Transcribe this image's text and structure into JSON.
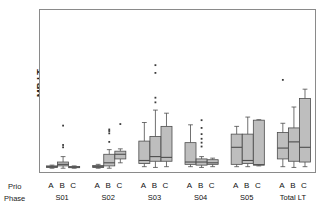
{
  "chart": {
    "type": "box",
    "ylabel": "MR LT",
    "prio_axis_label": "Prio",
    "phase_axis_label": "Phase"
  },
  "chart_data": {
    "type": "box",
    "title": "",
    "xlabel": "",
    "ylabel": "MR LT",
    "axis_rows": [
      "Prio",
      "Phase"
    ],
    "grid": false,
    "legend": "none",
    "y_tick_labels": [],
    "ylim": [
      0,
      100
    ],
    "groups": [
      "S01",
      "S02",
      "S03",
      "S04",
      "S05",
      "Total LT"
    ],
    "priorities": [
      "A",
      "B",
      "C"
    ],
    "box_fill": "#b3b3b3",
    "box_line": "#4d4d4d",
    "boxes": [
      {
        "group": "S01",
        "prio": "A",
        "whisker_low": 0.5,
        "q1": 1.0,
        "median": 1.5,
        "q3": 2.0,
        "whisker_high": 2.5,
        "outliers": []
      },
      {
        "group": "S01",
        "prio": "B",
        "whisker_low": 0.5,
        "q1": 2.0,
        "median": 3.0,
        "q3": 4.5,
        "whisker_high": 8.0,
        "outliers": [
          14.0,
          15.5,
          28.0
        ]
      },
      {
        "group": "S01",
        "prio": "C",
        "whisker_low": 0.5,
        "q1": 1.0,
        "median": 1.2,
        "q3": 1.6,
        "whisker_high": 2.0,
        "outliers": []
      },
      {
        "group": "S02",
        "prio": "A",
        "whisker_low": 0.5,
        "q1": 1.0,
        "median": 1.5,
        "q3": 2.2,
        "whisker_high": 3.0,
        "outliers": []
      },
      {
        "group": "S02",
        "prio": "B",
        "whisker_low": 0.5,
        "q1": 2.0,
        "median": 4.0,
        "q3": 9.5,
        "whisker_high": 12.5,
        "outliers": [
          17.5,
          23.0,
          24.5,
          25.5
        ]
      },
      {
        "group": "S02",
        "prio": "C",
        "whisker_low": 4.0,
        "q1": 6.5,
        "median": 9.5,
        "q3": 11.5,
        "whisker_high": 13.0,
        "outliers": [
          29.0
        ]
      },
      {
        "group": "S03",
        "prio": "A",
        "whisker_low": 1.5,
        "q1": 3.5,
        "median": 5.5,
        "q3": 18.0,
        "whisker_high": 30.0,
        "outliers": []
      },
      {
        "group": "S03",
        "prio": "B",
        "whisker_low": 1.0,
        "q1": 5.0,
        "median": 8.0,
        "q3": 21.0,
        "whisker_high": 38.0,
        "outliers": [
          43.0,
          46.0,
          62.0,
          67.0
        ]
      },
      {
        "group": "S03",
        "prio": "C",
        "whisker_low": 1.5,
        "q1": 5.0,
        "median": 7.5,
        "q3": 27.5,
        "whisker_high": 36.0,
        "outliers": []
      },
      {
        "group": "S04",
        "prio": "A",
        "whisker_low": 1.5,
        "q1": 3.0,
        "median": 4.5,
        "q3": 17.0,
        "whisker_high": 28.5,
        "outliers": []
      },
      {
        "group": "S04",
        "prio": "B",
        "whisker_low": 1.0,
        "q1": 2.5,
        "median": 4.5,
        "q3": 6.5,
        "whisker_high": 8.0,
        "outliers": [
          14.5,
          17.0,
          19.5,
          22.5,
          26.5,
          31.5
        ]
      },
      {
        "group": "S04",
        "prio": "C",
        "whisker_low": 1.5,
        "q1": 3.0,
        "median": 4.0,
        "q3": 6.0,
        "whisker_high": 7.0,
        "outliers": []
      },
      {
        "group": "S05",
        "prio": "A",
        "whisker_low": 1.5,
        "q1": 3.0,
        "median": 14.0,
        "q3": 22.5,
        "whisker_high": 27.5,
        "outliers": []
      },
      {
        "group": "S05",
        "prio": "B",
        "whisker_low": 1.5,
        "q1": 3.5,
        "median": 5.5,
        "q3": 22.5,
        "whisker_high": 33.5,
        "outliers": []
      },
      {
        "group": "S05",
        "prio": "C",
        "whisker_low": 2.0,
        "q1": 2.5,
        "median": 2.8,
        "q3": 31.5,
        "whisker_high": 31.8,
        "outliers": []
      },
      {
        "group": "Total LT",
        "prio": "A",
        "whisker_low": 1.5,
        "q1": 6.5,
        "median": 13.5,
        "q3": 23.5,
        "whisker_high": 29.5,
        "outliers": [
          57.5
        ]
      },
      {
        "group": "Total LT",
        "prio": "B",
        "whisker_low": 1.0,
        "q1": 5.0,
        "median": 17.5,
        "q3": 26.5,
        "whisker_high": 40.0,
        "outliers": []
      },
      {
        "group": "Total LT",
        "prio": "C",
        "whisker_low": 1.5,
        "q1": 4.5,
        "median": 14.0,
        "q3": 45.5,
        "whisker_high": 51.5,
        "outliers": []
      }
    ]
  }
}
